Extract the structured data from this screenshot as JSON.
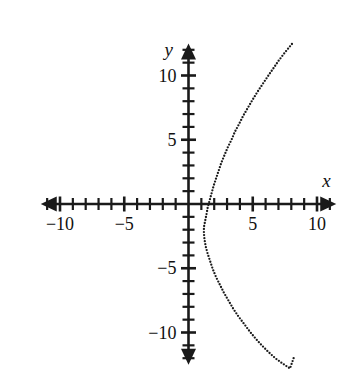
{
  "figure": {
    "background_color": "#ffffff",
    "ink_color": "#1a1a1a",
    "x_axis_name": "x",
    "y_axis_name": "y"
  },
  "axis_labels": {
    "x": "x",
    "y": "y"
  },
  "x_tick_labels": [
    {
      "value": -10,
      "text": "−10"
    },
    {
      "value": -5,
      "text": "−5"
    },
    {
      "value": 5,
      "text": "5"
    },
    {
      "value": 10,
      "text": "10"
    }
  ],
  "y_tick_labels": [
    {
      "value": 10,
      "text": "10"
    },
    {
      "value": 5,
      "text": "5"
    },
    {
      "value": -5,
      "text": "−5"
    },
    {
      "value": -10,
      "text": "−10"
    }
  ],
  "chart_data": {
    "type": "line",
    "title": "",
    "subtitle": "",
    "xlabel": "x",
    "ylabel": "y",
    "xlim": [
      -11.5,
      11.5
    ],
    "ylim": [
      -12.5,
      12.5
    ],
    "grid": false,
    "legend": null,
    "legend_position": "none",
    "x_ticks": [
      -11,
      -10,
      -9,
      -8,
      -7,
      -6,
      -5,
      -4,
      -3,
      -2,
      -1,
      1,
      2,
      3,
      4,
      5,
      6,
      7,
      8,
      9,
      10,
      11
    ],
    "y_ticks": [
      -12,
      -11,
      -10,
      -9,
      -8,
      -7,
      -6,
      -5,
      -4,
      -3,
      -2,
      -1,
      1,
      2,
      3,
      4,
      5,
      6,
      7,
      8,
      9,
      10,
      11,
      12
    ],
    "x_tick_labeled": [
      -10,
      -5,
      5,
      10
    ],
    "y_tick_labeled": [
      -10,
      -5,
      5,
      10
    ],
    "tick_interval": 1,
    "label_interval": 5,
    "axis_arrows": [
      "left",
      "right",
      "up",
      "down"
    ],
    "curve_style": "dotted",
    "vertex": [
      1.15,
      -1.8
    ],
    "x_intercept": [
      2.0,
      0
    ],
    "series": [
      {
        "name": "parabola",
        "style": "dotted",
        "points": [
          [
            8.05,
            12.45
          ],
          [
            7.55,
            11.85
          ],
          [
            7.05,
            11.2
          ],
          [
            6.6,
            10.55
          ],
          [
            6.15,
            9.9
          ],
          [
            5.75,
            9.3
          ],
          [
            5.35,
            8.7
          ],
          [
            4.95,
            8.05
          ],
          [
            4.6,
            7.45
          ],
          [
            4.25,
            6.85
          ],
          [
            3.95,
            6.25
          ],
          [
            3.6,
            5.6
          ],
          [
            3.35,
            5.0
          ],
          [
            3.05,
            4.4
          ],
          [
            2.8,
            3.8
          ],
          [
            2.55,
            3.2
          ],
          [
            2.35,
            2.6
          ],
          [
            2.15,
            2.0
          ],
          [
            1.95,
            1.4
          ],
          [
            1.8,
            0.85
          ],
          [
            1.65,
            0.3
          ],
          [
            1.5,
            -0.25
          ],
          [
            1.4,
            -0.8
          ],
          [
            1.3,
            -1.3
          ],
          [
            1.2,
            -1.8
          ],
          [
            1.2,
            -2.3
          ],
          [
            1.25,
            -2.8
          ],
          [
            1.35,
            -3.35
          ],
          [
            1.5,
            -3.9
          ],
          [
            1.7,
            -4.5
          ],
          [
            1.9,
            -5.1
          ],
          [
            2.15,
            -5.7
          ],
          [
            2.45,
            -6.3
          ],
          [
            2.75,
            -6.9
          ],
          [
            3.1,
            -7.5
          ],
          [
            3.45,
            -8.1
          ],
          [
            3.85,
            -8.7
          ],
          [
            4.3,
            -9.3
          ],
          [
            4.75,
            -9.9
          ],
          [
            5.2,
            -10.45
          ],
          [
            5.7,
            -11.0
          ],
          [
            6.2,
            -11.5
          ],
          [
            6.75,
            -12.0
          ],
          [
            7.3,
            -12.4
          ],
          [
            7.9,
            -12.8
          ],
          [
            8.25,
            -11.8
          ]
        ]
      }
    ]
  }
}
